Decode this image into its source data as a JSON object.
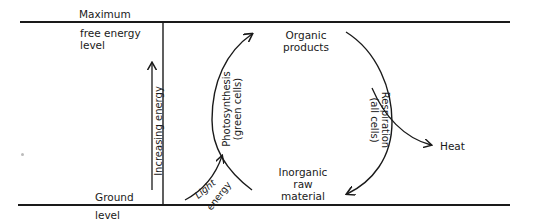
{
  "diagram": {
    "levels": {
      "maximum_label": "Maximum",
      "maximum_sublabel_line1": "free energy",
      "maximum_sublabel_line2": "level",
      "ground_label": "Ground",
      "ground_sublabel": "level"
    },
    "axis": {
      "label": "Increasing energy"
    },
    "nodes": {
      "organic_line1": "Organic",
      "organic_line2": "products",
      "inorganic_line1": "Inorganic",
      "inorganic_line2": "raw",
      "inorganic_line3": "material",
      "heat": "Heat"
    },
    "processes": {
      "photosynthesis_line1": "Photosynthesis",
      "photosynthesis_line2": "(green cells)",
      "respiration_line1": "Respiration",
      "respiration_line2": "(all cells)",
      "light_line1": "Light",
      "light_line2": "energy"
    },
    "colors": {
      "stroke": "#1a1a1a",
      "background": "#ffffff"
    }
  }
}
